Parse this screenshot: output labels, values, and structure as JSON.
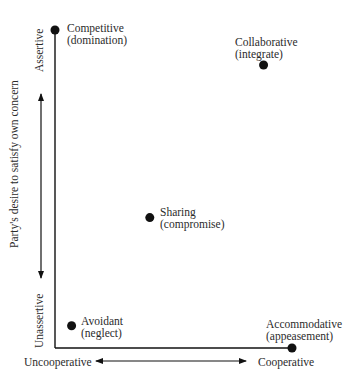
{
  "diagram": {
    "type": "conflict-styles-grid",
    "y_axis": {
      "title": "Party's desire to satisfy own concern",
      "high_label": "Assertive",
      "low_label": "Unassertive"
    },
    "x_axis": {
      "low_label": "Uncooperative",
      "high_label": "Cooperative"
    },
    "styles": [
      {
        "name": "Competitive",
        "alias": "(domination)",
        "assertiveness": 1.0,
        "cooperativeness": 0.0
      },
      {
        "name": "Collaborative",
        "alias": "(integrate)",
        "assertiveness": 0.89,
        "cooperativeness": 0.88
      },
      {
        "name": "Sharing",
        "alias": "(compromise)",
        "assertiveness": 0.41,
        "cooperativeness": 0.4
      },
      {
        "name": "Avoidant",
        "alias": "(neglect)",
        "assertiveness": 0.07,
        "cooperativeness": 0.07
      },
      {
        "name": "Accommodative",
        "alias": "(appeasement)",
        "assertiveness": 0.0,
        "cooperativeness": 1.0
      }
    ],
    "colors": {
      "ink": "#111111",
      "text": "#2b2b2b",
      "background": "#ffffff"
    }
  }
}
